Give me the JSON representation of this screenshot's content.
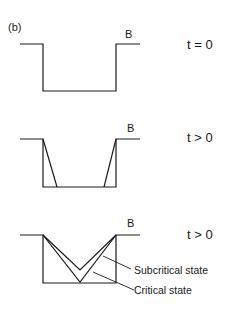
{
  "figure": {
    "label": "(b)",
    "panels": [
      {
        "id": "panel-1",
        "point_label": "B",
        "time_label": "t = 0",
        "state": "initial rectangular trench"
      },
      {
        "id": "panel-2",
        "point_label": "B",
        "time_label": "t > 0",
        "state": "slopes collapsing at walls"
      },
      {
        "id": "panel-3",
        "point_label": "B",
        "time_label": "t > 0",
        "state": "V-shaped profiles",
        "annotations": [
          "Subcritical state",
          "Critical state"
        ]
      }
    ],
    "colors": {
      "line": "#1a1a1a",
      "background": "#ffffff"
    }
  }
}
